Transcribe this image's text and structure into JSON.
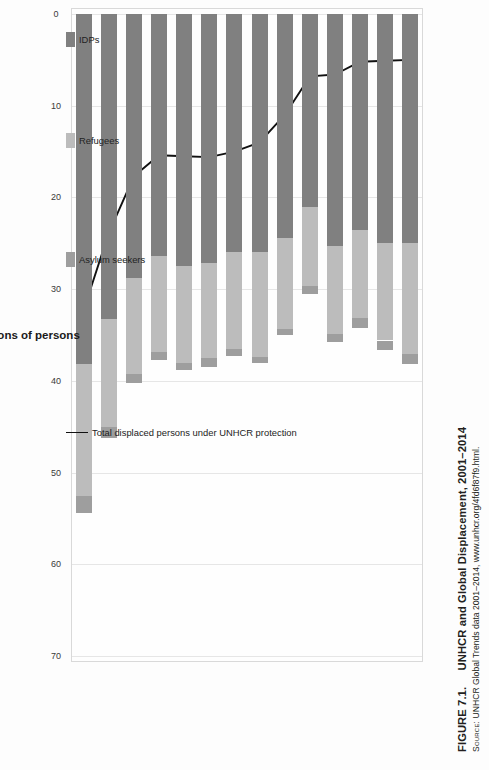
{
  "figure": {
    "number": "FIGURE 7.1.",
    "title": "UNHCR and Global Displacement, 2001–2014",
    "source_label": "Source:",
    "source_text": "UNHCR Global Trends data 2001–2014, www.unhcr.org/4fd6f87f9.html."
  },
  "colors": {
    "idps": "#808080",
    "refugees": "#bcbcbc",
    "asylum": "#9e9e9e",
    "line": "#111111",
    "grid": "#e6e6e6",
    "frame": "#d9d9d9",
    "background": "#fdfdfd"
  },
  "legend": {
    "items": [
      {
        "label": "IDPs",
        "marker": "swatch",
        "color": "#808080"
      },
      {
        "label": "Refugees",
        "marker": "swatch",
        "color": "#bcbcbc"
      },
      {
        "label": "Asylum seekers",
        "marker": "swatch",
        "color": "#9e9e9e"
      },
      {
        "label": "Total displaced persons under UNHCR protection",
        "marker": "line",
        "color": "#111111"
      }
    ]
  },
  "chart_data": {
    "type": "bar",
    "orientation": "horizontal-stacked",
    "title": "UNHCR and Global Displacement, 2001–2014",
    "xlabel": "",
    "ylabel": "Millions of persons",
    "ylim": [
      0,
      70
    ],
    "yticks": [
      0,
      10,
      20,
      30,
      40,
      50,
      60,
      70
    ],
    "grid": true,
    "legend_position": "bottom",
    "categories": [
      "2001",
      "2002",
      "2003",
      "2004",
      "2005",
      "2006",
      "2007",
      "2008",
      "2009",
      "2010",
      "2011",
      "2012",
      "2013",
      "2014"
    ],
    "series": [
      {
        "name": "IDPs",
        "color": "#808080",
        "values": [
          25.0,
          25.0,
          23.6,
          25.3,
          21.0,
          24.4,
          26.0,
          26.0,
          27.1,
          27.5,
          26.4,
          28.8,
          33.3,
          38.2
        ]
      },
      {
        "name": "Refugees",
        "color": "#bcbcbc",
        "values": [
          12.1,
          10.6,
          9.6,
          9.6,
          8.7,
          9.9,
          11.4,
          10.5,
          10.4,
          10.5,
          10.4,
          10.5,
          11.7,
          14.4
        ]
      },
      {
        "name": "Asylum seekers",
        "color": "#9e9e9e",
        "values": [
          1.1,
          1.0,
          1.0,
          0.9,
          0.8,
          0.7,
          0.7,
          0.8,
          1.0,
          0.8,
          0.9,
          0.9,
          1.2,
          1.8
        ]
      }
    ],
    "line_series": {
      "name": "Total displaced persons under UNHCR protection",
      "color": "#111111",
      "values": [
        5.0,
        5.1,
        5.2,
        6.6,
        6.8,
        11.0,
        14.0,
        15.0,
        15.6,
        15.5,
        15.4,
        17.7,
        23.9,
        32.3
      ]
    }
  },
  "axis": {
    "tick_labels": [
      "0",
      "10",
      "20",
      "30",
      "40",
      "50",
      "60",
      "70"
    ],
    "title": "Millions of persons"
  }
}
